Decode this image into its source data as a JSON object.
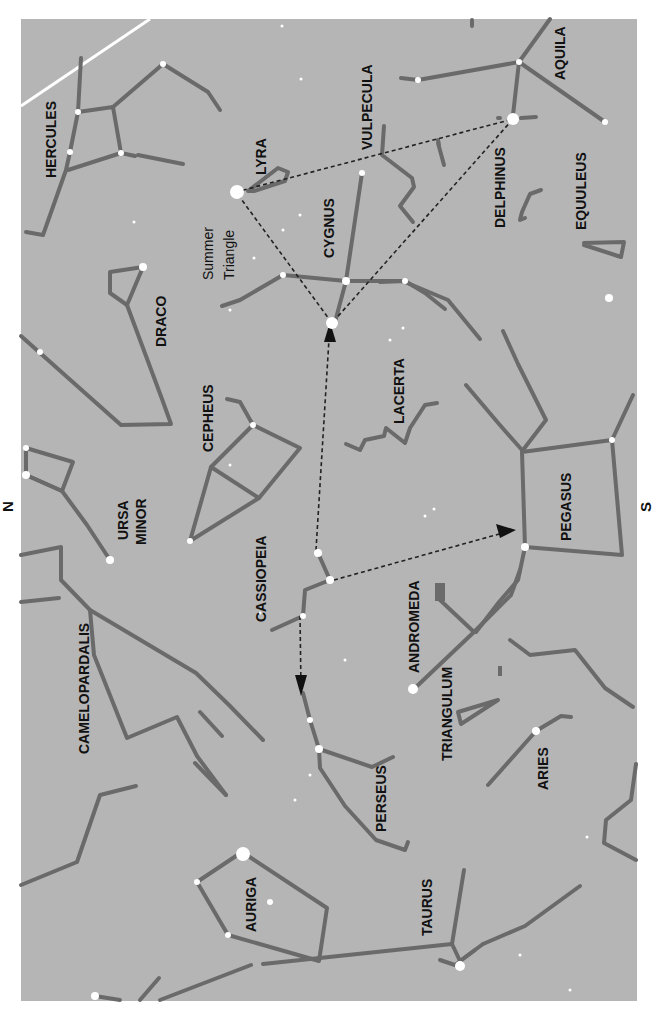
{
  "map": {
    "title": "Autumn star chart - Summer Triangle to Perseus",
    "orientation_labels": {
      "north": "N",
      "south": "S"
    },
    "colors": {
      "sky": "#b5b5b5",
      "constellation_line": "#6a6a6a",
      "star": "#ffffff",
      "pointer": "#222222",
      "ecliptic": "#ffffff"
    },
    "constellations": [
      {
        "name": "HERCULES"
      },
      {
        "name": "LYRA"
      },
      {
        "name": "VULPECULA"
      },
      {
        "name": "AQUILA"
      },
      {
        "name": "DELPHINUS"
      },
      {
        "name": "EQUULEUS"
      },
      {
        "name": "CYGNUS"
      },
      {
        "name": "DRACO"
      },
      {
        "name": "CEPHEUS"
      },
      {
        "name": "LACERTA"
      },
      {
        "name": "URSA MINOR"
      },
      {
        "name": "CASSIOPEIA"
      },
      {
        "name": "PEGASUS"
      },
      {
        "name": "ANDROMEDA"
      },
      {
        "name": "CAMELOPARDALIS"
      },
      {
        "name": "TRIANGULUM"
      },
      {
        "name": "PERSEUS"
      },
      {
        "name": "ARIES"
      },
      {
        "name": "AURIGA"
      },
      {
        "name": "TAURUS"
      }
    ],
    "labels": {
      "hercules": "HERCULES",
      "lyra": "LYRA",
      "vulpecula": "VULPECULA",
      "aquila": "AQUILA",
      "delphinus": "DELPHINUS",
      "equuleus": "EQUULEUS",
      "cygnus": "CYGNUS",
      "summer_triangle_1": "Summer",
      "summer_triangle_2": "Triangle",
      "draco": "DRACO",
      "cepheus": "CEPHEUS",
      "lacerta": "LACERTA",
      "ursa_minor_1": "URSA",
      "ursa_minor_2": "MINOR",
      "cassiopeia": "CASSIOPEIA",
      "pegasus": "PEGASUS",
      "andromeda": "ANDROMEDA",
      "camelopardalis": "CAMELOPARDALIS",
      "triangulum": "TRIANGULUM",
      "perseus": "PERSEUS",
      "aries": "ARIES",
      "auriga": "AURIGA",
      "taurus": "TAURUS"
    },
    "asterism": {
      "name": "Summer Triangle",
      "vertices": [
        "Vega (LYRA)",
        "Deneb (CYGNUS)",
        "Altair (AQUILA)"
      ]
    },
    "pointers": [
      {
        "from": "CASSIOPEIA",
        "to": "CYGNUS"
      },
      {
        "from": "CASSIOPEIA",
        "to": "PEGASUS"
      },
      {
        "from": "CASSIOPEIA",
        "to": "PERSEUS"
      }
    ]
  }
}
